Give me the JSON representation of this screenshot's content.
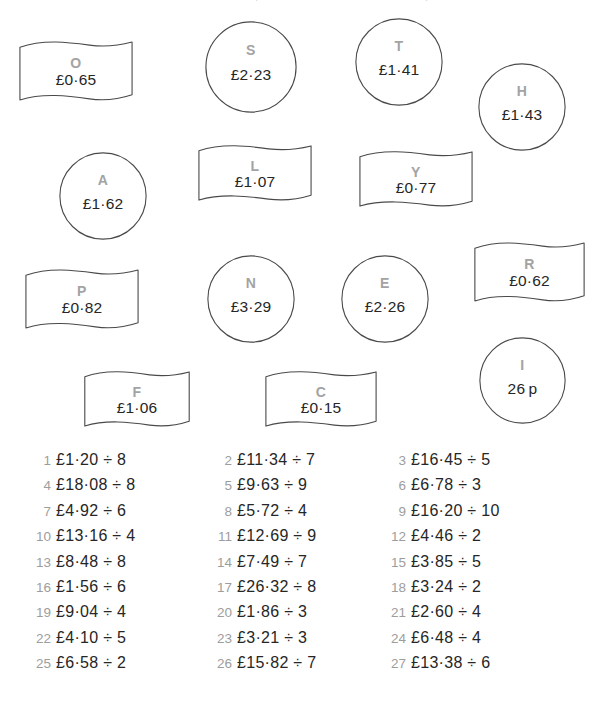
{
  "page": {
    "background_color": "#ffffff",
    "letter_color": "#a3a3a3",
    "value_color": "#262626",
    "outline_color": "#4a4a4a",
    "number_color": "#9d9d9d"
  },
  "tokens": [
    {
      "letter": "O",
      "value": "£0·65",
      "shape": "banner",
      "x": 18,
      "y": 40,
      "w": 116,
      "h": 62
    },
    {
      "letter": "S",
      "value": "£2·23",
      "shape": "circle",
      "x": 205,
      "y": 21,
      "w": 92,
      "h": 92
    },
    {
      "letter": "T",
      "value": "£1·41",
      "shape": "circle",
      "x": 355,
      "y": 18,
      "w": 88,
      "h": 88
    },
    {
      "letter": "H",
      "value": "£1·43",
      "shape": "circle",
      "x": 478,
      "y": 63,
      "w": 88,
      "h": 88
    },
    {
      "letter": "A",
      "value": "£1·62",
      "shape": "circle",
      "x": 59,
      "y": 152,
      "w": 88,
      "h": 88
    },
    {
      "letter": "L",
      "value": "£1·07",
      "shape": "banner",
      "x": 197,
      "y": 144,
      "w": 116,
      "h": 58
    },
    {
      "letter": "Y",
      "value": "£0·77",
      "shape": "banner",
      "x": 358,
      "y": 150,
      "w": 116,
      "h": 58
    },
    {
      "letter": "P",
      "value": "£0·82",
      "shape": "banner",
      "x": 24,
      "y": 268,
      "w": 116,
      "h": 62
    },
    {
      "letter": "N",
      "value": "£3·29",
      "shape": "circle",
      "x": 207,
      "y": 255,
      "w": 88,
      "h": 88
    },
    {
      "letter": "E",
      "value": "£2·26",
      "shape": "circle",
      "x": 341,
      "y": 255,
      "w": 88,
      "h": 88
    },
    {
      "letter": "R",
      "value": "£0·62",
      "shape": "banner",
      "x": 473,
      "y": 241,
      "w": 113,
      "h": 62
    },
    {
      "letter": "F",
      "value": "£1·06",
      "shape": "banner",
      "x": 83,
      "y": 370,
      "w": 108,
      "h": 58
    },
    {
      "letter": "C",
      "value": "£0·15",
      "shape": "banner",
      "x": 264,
      "y": 370,
      "w": 114,
      "h": 58
    },
    {
      "letter": "I",
      "value": "26 p",
      "shape": "circle",
      "x": 479,
      "y": 337,
      "w": 87,
      "h": 87
    }
  ],
  "questions": {
    "columns": [
      [
        {
          "number": "1",
          "expression": "£1·20 ÷ 8"
        },
        {
          "number": "4",
          "expression": "£18·08 ÷ 8"
        },
        {
          "number": "7",
          "expression": "£4·92 ÷ 6"
        },
        {
          "number": "10",
          "expression": "£13·16 ÷ 4"
        },
        {
          "number": "13",
          "expression": "£8·48 ÷ 8"
        },
        {
          "number": "16",
          "expression": "£1·56 ÷ 6"
        },
        {
          "number": "19",
          "expression": "£9·04 ÷ 4"
        },
        {
          "number": "22",
          "expression": "£4·10 ÷ 5"
        },
        {
          "number": "25",
          "expression": "£6·58 ÷ 2"
        }
      ],
      [
        {
          "number": "2",
          "expression": "£11·34 ÷ 7"
        },
        {
          "number": "5",
          "expression": "£9·63 ÷ 9"
        },
        {
          "number": "8",
          "expression": "£5·72 ÷ 4"
        },
        {
          "number": "11",
          "expression": "£12·69 ÷ 9"
        },
        {
          "number": "14",
          "expression": "£7·49 ÷ 7"
        },
        {
          "number": "17",
          "expression": "£26·32 ÷ 8"
        },
        {
          "number": "20",
          "expression": "£1·86 ÷ 3"
        },
        {
          "number": "23",
          "expression": "£3·21 ÷ 3"
        },
        {
          "number": "26",
          "expression": "£15·82 ÷ 7"
        }
      ],
      [
        {
          "number": "3",
          "expression": "£16·45 ÷ 5"
        },
        {
          "number": "6",
          "expression": "£6·78 ÷ 3"
        },
        {
          "number": "9",
          "expression": "£16·20 ÷ 10"
        },
        {
          "number": "12",
          "expression": "£4·46 ÷ 2"
        },
        {
          "number": "15",
          "expression": "£3·85 ÷ 5"
        },
        {
          "number": "18",
          "expression": "£3·24 ÷ 2"
        },
        {
          "number": "21",
          "expression": "£2·60 ÷ 4"
        },
        {
          "number": "24",
          "expression": "£6·48 ÷ 4"
        },
        {
          "number": "27",
          "expression": "£13·38 ÷ 6"
        }
      ]
    ]
  }
}
